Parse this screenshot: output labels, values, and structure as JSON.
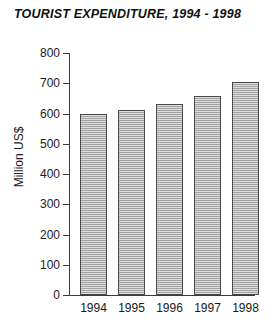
{
  "chart_data": {
    "type": "bar",
    "title": "TOURIST EXPENDITURE, 1994 - 1998",
    "xlabel": "",
    "ylabel": "Million US$",
    "categories": [
      "1994",
      "1995",
      "1996",
      "1997",
      "1998"
    ],
    "values": [
      597,
      610,
      632,
      657,
      705
    ],
    "ylim": [
      0,
      800
    ],
    "yticks": [
      0,
      100,
      200,
      300,
      400,
      500,
      600,
      700,
      800
    ],
    "ytick_labels": [
      "0",
      "100",
      "200",
      "300",
      "400",
      "500",
      "600",
      "700",
      "800"
    ],
    "grid": false,
    "legend": null,
    "series": [
      {
        "name": "Tourist expenditure",
        "values": [
          597,
          610,
          632,
          657,
          705
        ]
      }
    ],
    "bar_fill_color": "#b4b4b4",
    "bar_border_color": "#4a4a4a",
    "axis_color": "#3a3a3a",
    "background_color": "#ffffff"
  }
}
